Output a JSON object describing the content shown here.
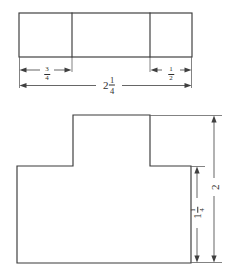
{
  "drawing": {
    "title": "Dimensioned figures: segmented rectangle and T-shape",
    "stroke_color": "#3a3a3a",
    "dimension_color": "#4a4a4a",
    "background_color": "#ffffff",
    "top_figure": {
      "name": "segmented-rectangle",
      "segments": 3,
      "dimensions": [
        {
          "id": "left-segment-width",
          "whole": "",
          "numerator": "3",
          "denominator": "4",
          "orientation": "horizontal"
        },
        {
          "id": "right-segment-width",
          "whole": "",
          "numerator": "1",
          "denominator": "2",
          "orientation": "horizontal"
        },
        {
          "id": "overall-width",
          "whole": "2",
          "numerator": "1",
          "denominator": "4",
          "orientation": "horizontal"
        }
      ]
    },
    "bottom_figure": {
      "name": "t-shape",
      "dimensions": [
        {
          "id": "overall-height",
          "whole": "2",
          "numerator": "",
          "denominator": "",
          "orientation": "vertical"
        },
        {
          "id": "base-height",
          "whole": "1",
          "numerator": "1",
          "denominator": "4",
          "orientation": "vertical"
        }
      ]
    }
  }
}
